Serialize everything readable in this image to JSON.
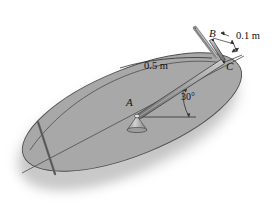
{
  "figure": {
    "background_color": "#ffffff",
    "disk_fill_color": "#a8a8a8",
    "disk_stroke_color": "#4a4a4a",
    "shadow_color": "#bdbdbd",
    "rod_color": "#8f8f8f",
    "rod_stroke_color": "#4a4a4a",
    "text_color": "#111111"
  },
  "labels": {
    "point_a": "A",
    "point_b": "B",
    "point_c": "C",
    "length_ac": "0.5 m",
    "length_bc": "0.1 m",
    "angle": "30°"
  },
  "geometry": {
    "pivot_a": {
      "x": 137,
      "y": 117
    },
    "point_b": {
      "x": 212,
      "y": 42
    },
    "point_c": {
      "x": 224,
      "y": 63
    },
    "angle_degrees": 30,
    "rod_length_m": 0.5,
    "offset_bc_m": 0.1,
    "disk_center": {
      "x": 132,
      "y": 113
    },
    "disk_radius_x": 118,
    "disk_radius_y": 44,
    "disk_rotation_deg": -22
  }
}
